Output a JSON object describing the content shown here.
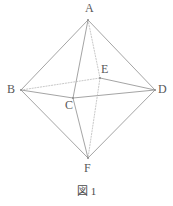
{
  "figure": {
    "caption_label": "図",
    "caption_number": "1",
    "stroke_color": "#8d8d8d",
    "stroke_color_hidden": "#b0b0b0",
    "label_color": "#585858",
    "background_color": "#ffffff",
    "canvas": {
      "width": 173,
      "height": 206
    },
    "vertices": [
      {
        "id": "A",
        "label": "A",
        "x": 88,
        "y": 20,
        "label_x": 85,
        "label_y": 2
      },
      {
        "id": "B",
        "label": "B",
        "x": 21,
        "y": 90,
        "label_x": 7,
        "label_y": 83
      },
      {
        "id": "C",
        "label": "C",
        "x": 73,
        "y": 98,
        "label_x": 65,
        "label_y": 99
      },
      {
        "id": "D",
        "label": "D",
        "x": 155,
        "y": 90,
        "label_x": 158,
        "label_y": 83
      },
      {
        "id": "E",
        "label": "E",
        "x": 100,
        "y": 78,
        "label_x": 101,
        "label_y": 63
      },
      {
        "id": "F",
        "label": "F",
        "x": 88,
        "y": 158,
        "label_x": 84,
        "label_y": 162
      }
    ],
    "edges": [
      {
        "from": "A",
        "to": "B",
        "style": "solid"
      },
      {
        "from": "A",
        "to": "D",
        "style": "solid"
      },
      {
        "from": "B",
        "to": "F",
        "style": "solid"
      },
      {
        "from": "D",
        "to": "F",
        "style": "solid"
      },
      {
        "from": "A",
        "to": "C",
        "style": "solid"
      },
      {
        "from": "C",
        "to": "F",
        "style": "solid"
      },
      {
        "from": "B",
        "to": "C",
        "style": "solid"
      },
      {
        "from": "C",
        "to": "D",
        "style": "solid"
      },
      {
        "from": "A",
        "to": "E",
        "style": "dotted"
      },
      {
        "from": "E",
        "to": "F",
        "style": "dotted"
      },
      {
        "from": "B",
        "to": "E",
        "style": "dotted"
      },
      {
        "from": "E",
        "to": "D",
        "style": "solid"
      }
    ]
  }
}
